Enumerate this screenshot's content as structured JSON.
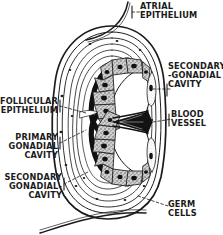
{
  "figure": {
    "type": "biological-diagram",
    "width": 223,
    "height": 235,
    "background_color": "#ffffff",
    "ink_color": "#1b1b1b",
    "style": "black-and-white engraved line drawing with stipple shading"
  },
  "labels": {
    "atrial_epithelium": "ATRIAL\nEPITHELIUM",
    "secondary_gonadial_cavity_right": "SECONDARY\n-GONADIAL\nCAVITY",
    "blood_vessel": "BLOOD\nVESSEL",
    "germ_cells": "GERM\nCELLS",
    "follicular_epithelium": "FOLLICULAR\nEPITHELIUM",
    "primary_gonadial_cavity": "PRIMARY\nGONADIAL\nCAVITY",
    "secondary_gonadial_cavity_left": "SECONDARY\nGONADIAL-\nCAVITY"
  },
  "structures": [
    {
      "name": "atrial-epithelium",
      "description": "thin membrane sweeping off the top and bottom of the ovoid body"
    },
    {
      "name": "outer-envelope",
      "description": "nested concentric ovoid outlines forming the gonad wall"
    },
    {
      "name": "follicular-epithelium",
      "description": "layered epithelium lining the inner wall"
    },
    {
      "name": "primary-gonadial-cavity",
      "description": "inner clear space bounded by follicular epithelium"
    },
    {
      "name": "secondary-gonadial-cavity-upper",
      "description": "upper comma-shaped clear lumen"
    },
    {
      "name": "secondary-gonadial-cavity-lower",
      "description": "lower comma-shaped clear lumen"
    },
    {
      "name": "blood-vessel",
      "description": "dark wedge-shaped vessel at the mid-right of the central septum"
    },
    {
      "name": "germ-cells-upper",
      "description": "arc of large polygonal cells with dark nuclei, upper lobe"
    },
    {
      "name": "germ-cells-lower",
      "description": "arc of large polygonal cells with dark nuclei, lower lobe"
    }
  ],
  "leader_lines": {
    "style": "dashed",
    "count": 7
  }
}
